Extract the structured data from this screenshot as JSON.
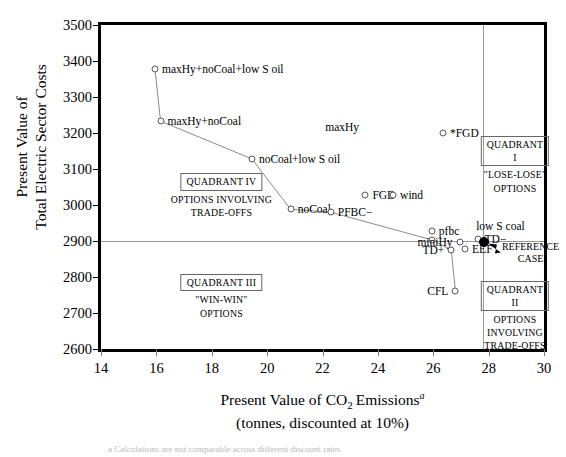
{
  "chart_data": {
    "type": "scatter",
    "title": "",
    "xlabel": "Present Value of CO2 Emissions",
    "xlabel_sub": "(tonnes, discounted at 10%)",
    "ylabel_line1": "Present Value of",
    "ylabel_line2": "Total Electric Sector Costs",
    "xlim": [
      14,
      30
    ],
    "ylim": [
      2600,
      3500
    ],
    "xticks": [
      14,
      16,
      18,
      20,
      22,
      24,
      26,
      28,
      30
    ],
    "yticks": [
      2600,
      2700,
      2800,
      2900,
      3000,
      3100,
      3200,
      3300,
      3400,
      3500
    ],
    "grid": false,
    "legend": "none",
    "reference_lines": {
      "horizontal_y": 2900,
      "vertical_x": 27.8
    },
    "points": [
      {
        "label": "maxHy+noCoal+low S oil",
        "x": 15.95,
        "y": 3377,
        "side": "right",
        "marker": "open"
      },
      {
        "label": "maxHy+noCoal",
        "x": 16.15,
        "y": 3233,
        "side": "right",
        "marker": "open"
      },
      {
        "label": "noCoal+low S oil",
        "x": 19.45,
        "y": 3128,
        "side": "right",
        "marker": "open"
      },
      {
        "label": "noCoal",
        "x": 20.85,
        "y": 2988,
        "side": "right",
        "marker": "open"
      },
      {
        "label": "PFBC−",
        "x": 22.3,
        "y": 2980,
        "side": "right",
        "marker": "open"
      },
      {
        "label": "FGD",
        "x": 23.55,
        "y": 3028,
        "side": "right",
        "marker": "open"
      },
      {
        "label": "wind",
        "x": 24.55,
        "y": 3028,
        "side": "right",
        "marker": "open"
      },
      {
        "label": "*FGD",
        "x": 26.35,
        "y": 3200,
        "side": "right",
        "marker": "open"
      },
      {
        "label": "pfbc",
        "x": 25.95,
        "y": 2928,
        "side": "right",
        "marker": "open"
      },
      {
        "label": "",
        "x": 25.95,
        "y": 2903,
        "side": "right",
        "marker": "open"
      },
      {
        "label": "miniHy",
        "x": 26.95,
        "y": 2898,
        "side": "left",
        "marker": "open"
      },
      {
        "label": "TD+",
        "x": 26.65,
        "y": 2875,
        "side": "left",
        "marker": "open"
      },
      {
        "label": "EEF",
        "x": 27.15,
        "y": 2877,
        "side": "right",
        "marker": "open"
      },
      {
        "label": "TD−",
        "x": 27.6,
        "y": 2905,
        "side": "right",
        "marker": "open"
      },
      {
        "label": "CFL",
        "x": 26.8,
        "y": 2762,
        "side": "left",
        "marker": "open"
      },
      {
        "label": "",
        "x": 27.83,
        "y": 2896,
        "side": "right",
        "marker": "filled"
      }
    ],
    "free_labels": [
      {
        "text": "maxHy",
        "x": 22.1,
        "y": 3218
      },
      {
        "text": "low S coal",
        "x": 27.55,
        "y": 2941
      }
    ],
    "connected_path": [
      {
        "x": 15.95,
        "y": 3377
      },
      {
        "x": 16.15,
        "y": 3233
      },
      {
        "x": 19.45,
        "y": 3128
      },
      {
        "x": 20.85,
        "y": 2988
      },
      {
        "x": 22.3,
        "y": 2980
      },
      {
        "x": 25.95,
        "y": 2903
      },
      {
        "x": 26.65,
        "y": 2875
      },
      {
        "x": 26.8,
        "y": 2762
      }
    ],
    "reference_case": {
      "label_line1": "REFERENCE",
      "label_line2": "CASE",
      "x": 27.83,
      "y": 2896
    },
    "quadrants": [
      {
        "name": "QUADRANT I",
        "body": "\"LOSE-LOSE\"\nOPTIONS",
        "x": 28.95,
        "y": 3192
      },
      {
        "name": "QUADRANT II",
        "body": "OPTIONS\nINVOLVING\nTRADE-OFFS",
        "x": 28.95,
        "y": 2790
      },
      {
        "name": "QUADRANT III",
        "body": "\"WIN-WIN\"\nOPTIONS",
        "x": 18.35,
        "y": 2808
      },
      {
        "name": "QUADRANT IV",
        "body": "OPTIONS INVOLVING\nTRADE-OFFS",
        "x": 18.35,
        "y": 3088
      }
    ],
    "footnote": "a Calculations are not comparable across different discount rates."
  }
}
